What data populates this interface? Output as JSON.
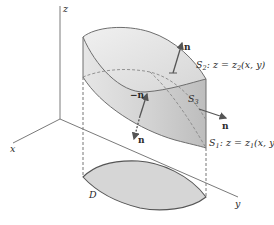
{
  "figure": {
    "type": "surface-diagram",
    "axes": {
      "x_label": "x",
      "y_label": "y",
      "z_label": "z"
    },
    "region_label": "D",
    "surfaces": {
      "top": {
        "name": "S",
        "sub": "2",
        "equation_prefix": ": z = z",
        "equation_sub": "2",
        "equation_suffix": "(x, y)"
      },
      "side": {
        "name": "S",
        "sub": "3"
      },
      "bottom": {
        "name": "S",
        "sub": "1",
        "equation_prefix": ": z = z",
        "equation_sub": "1",
        "equation_suffix": "(x, y)"
      }
    },
    "normals": {
      "top": "n",
      "side": "n",
      "inner_up": "−n",
      "inner_down": "n"
    },
    "colors": {
      "solid_fill": "#d9d9d9",
      "solid_shade": "#b8b8b8",
      "edge": "#6e6e6e",
      "axis": "#7a7a7a",
      "arrow": "#555555"
    }
  }
}
